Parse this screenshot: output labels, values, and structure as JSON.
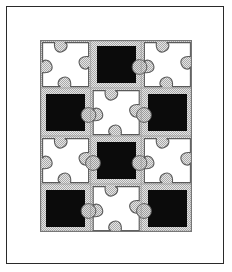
{
  "artwork": {
    "title": "Framed jigsaw tessellation print",
    "frame": {
      "border_color": "#2a2a2a",
      "matte_color": "#ffffff",
      "border_width_px": 1.4
    },
    "plate": {
      "x": 40,
      "y": 40,
      "width": 152,
      "height": 192,
      "background_color": "#ffffff",
      "edge_color": "#777777"
    },
    "palette": {
      "dark": "#0b0b0b",
      "light": "#ffffff",
      "halftone_gray": "#c8c8c8",
      "tab_gray": "#c2c2c2",
      "outline_gray": "#5a5a5a",
      "grid_rule_gray": "#9a9a9a"
    },
    "grid": {
      "columns": 3,
      "rows": 4,
      "cell_width": 50.6,
      "cell_height": 48.0,
      "pattern_name": "checkerboard",
      "cells": [
        {
          "row": 0,
          "col": 0,
          "fill": "light"
        },
        {
          "row": 0,
          "col": 1,
          "fill": "dark"
        },
        {
          "row": 0,
          "col": 2,
          "fill": "light"
        },
        {
          "row": 1,
          "col": 0,
          "fill": "dark"
        },
        {
          "row": 1,
          "col": 1,
          "fill": "light"
        },
        {
          "row": 1,
          "col": 2,
          "fill": "dark"
        },
        {
          "row": 2,
          "col": 0,
          "fill": "light"
        },
        {
          "row": 2,
          "col": 1,
          "fill": "dark"
        },
        {
          "row": 2,
          "col": 2,
          "fill": "light"
        },
        {
          "row": 3,
          "col": 0,
          "fill": "dark"
        },
        {
          "row": 3,
          "col": 1,
          "fill": "light"
        },
        {
          "row": 3,
          "col": 2,
          "fill": "dark"
        }
      ]
    },
    "motifs": {
      "dark_cell": "inset solid black square on halftone gray ground",
      "light_cell": "white jigsaw piece with rounded tab and notch on halftone gray ground",
      "tab_shape": "circle",
      "notch_shape": "wedge"
    }
  }
}
